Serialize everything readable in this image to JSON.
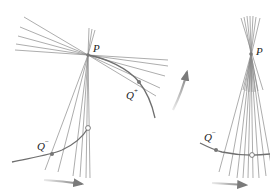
{
  "figure": {
    "left_panel": {
      "point_P": {
        "label": "P",
        "x": 88,
        "y": 55
      },
      "point_Q_plus": {
        "label": "Q",
        "superscript": "+",
        "x": 139,
        "y": 82
      },
      "point_Q_minus": {
        "label": "Q",
        "superscript": "−",
        "x": 52,
        "y": 154
      },
      "open_circle": {
        "x": 88,
        "y": 128
      },
      "motion_arrows": [
        "bottom-rightward",
        "middle-upward"
      ]
    },
    "right_panel": {
      "point_P": {
        "label": "P",
        "x": 251,
        "y": 54
      },
      "point_Q_minus": {
        "label": "Q",
        "superscript": "−",
        "x": 216,
        "y": 150
      },
      "open_circle": {
        "x": 252,
        "y": 155
      },
      "motion_arrows": [
        "bottom-rightward"
      ]
    },
    "colors": {
      "rays": "#8a8a8a",
      "curve": "#6f6f6f",
      "arrow": "#7a7a7a",
      "point_fill": "#777777",
      "text": "#222222"
    }
  }
}
